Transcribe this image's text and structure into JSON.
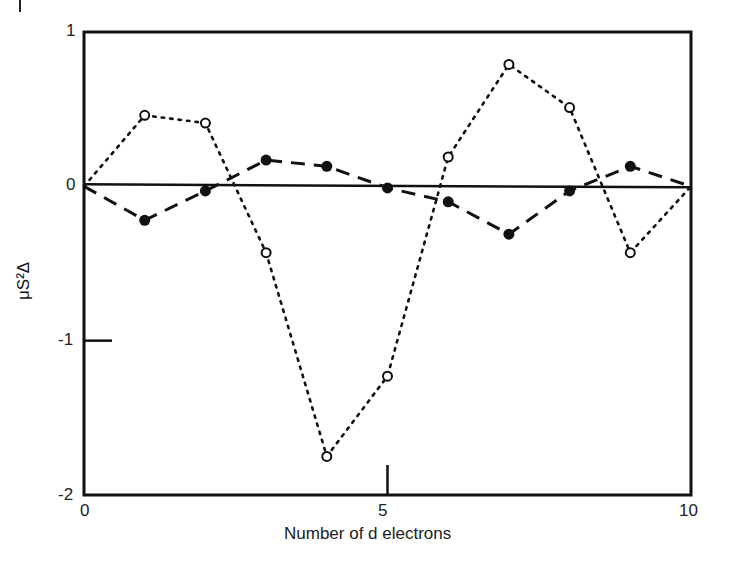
{
  "chart_data": {
    "type": "line",
    "title": "",
    "xlabel": "Number of d electrons",
    "ylabel": "μS²Δ",
    "xlim": [
      0,
      10
    ],
    "ylim": [
      -2,
      1
    ],
    "x_ticks": [
      "0",
      "5",
      "10"
    ],
    "y_ticks": [
      "1",
      "0",
      "-1",
      "-2"
    ],
    "grid": false,
    "legend": null,
    "x": [
      0,
      1,
      2,
      3,
      4,
      5,
      6,
      7,
      8,
      9,
      10
    ],
    "series": [
      {
        "name": "open circles (dotted)",
        "marker": "open-circle",
        "linestyle": "dotted",
        "values": [
          0.0,
          0.46,
          0.41,
          -0.43,
          -1.75,
          -1.23,
          0.19,
          0.79,
          0.51,
          -0.43,
          0.0
        ]
      },
      {
        "name": "filled circles (dashed)",
        "marker": "filled-circle",
        "linestyle": "dashed",
        "values": [
          0.0,
          -0.22,
          -0.03,
          0.17,
          0.13,
          -0.01,
          -0.1,
          -0.31,
          -0.03,
          0.13,
          0.0
        ]
      }
    ],
    "reference_line": {
      "y": 0,
      "style": "solid"
    }
  },
  "labels": {
    "xlabel": "Number of d electrons",
    "ylabel": "μS²Δ",
    "xt0": "0",
    "xt5": "5",
    "xt10": "10",
    "yt1": "1",
    "yt0": "0",
    "ytm1": "-1",
    "ytm2": "-2"
  }
}
